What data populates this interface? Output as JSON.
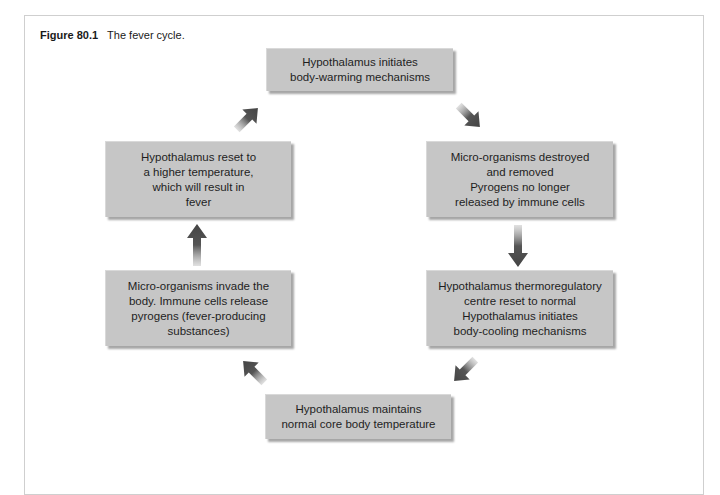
{
  "figure": {
    "number": "Figure 80.1",
    "title": "The fever cycle."
  },
  "nodes": {
    "top": {
      "lines": [
        "Hypothalamus initiates",
        "body-warming mechanisms"
      ]
    },
    "right_top": {
      "lines": [
        "Micro-organisms destroyed",
        "and removed",
        "Pyrogens no longer",
        "released by immune cells"
      ]
    },
    "right_bottom": {
      "lines": [
        "Hypothalamus thermoregulatory",
        "centre reset to normal",
        "Hypothalamus initiates",
        "body-cooling mechanisms"
      ]
    },
    "bottom": {
      "lines": [
        "Hypothalamus maintains",
        "normal core body temperature"
      ]
    },
    "left_bottom": {
      "lines": [
        "Micro-organisms invade the",
        "body. Immune cells release",
        "pyrogens (fever-producing",
        "substances)"
      ]
    },
    "left_top": {
      "lines": [
        "Hypothalamus reset to",
        "a higher temperature,",
        "which will result in",
        "fever"
      ]
    }
  },
  "flow": [
    "left_top -> top",
    "top -> right_top",
    "right_top -> right_bottom",
    "right_bottom -> bottom",
    "bottom -> left_bottom",
    "left_bottom -> left_top"
  ],
  "colors": {
    "box_fill": "#c6c6c6",
    "arrow": "#4a4a4a",
    "frame_border": "#cfcfcf"
  }
}
